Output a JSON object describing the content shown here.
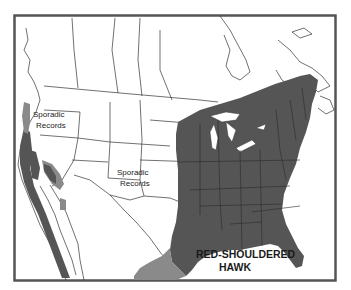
{
  "map": {
    "title_line1": "RED-SHOULDERED",
    "title_line2": "HAWK",
    "annotations": [
      {
        "line1": "Sporadic",
        "line2": "Records",
        "region": "pacific-northwest"
      },
      {
        "line1": "Sporadic",
        "line2": "Records",
        "region": "southern-plains"
      }
    ],
    "legend_colors": {
      "core_range": "#555555",
      "secondary_range": "#8a8a8a",
      "land": "#ffffff",
      "borders": "#333333",
      "frame": "#555555"
    }
  }
}
